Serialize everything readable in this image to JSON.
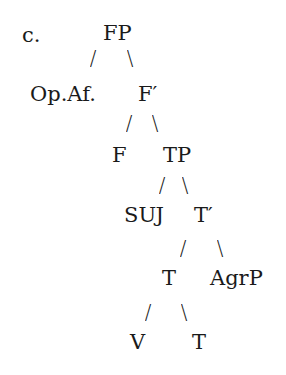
{
  "example_label": "c.",
  "tree": {
    "nodes": {
      "FP": "FP",
      "OpAf": "Op.Af.",
      "Fbar": "F′",
      "F": "F",
      "TP": "TP",
      "SUJ": "SUJ",
      "Tbar": "T′",
      "T_head": "T",
      "AgrP": "AgrP",
      "V": "V",
      "T_leaf": "T"
    },
    "branches": {
      "left": "/",
      "right": "\\"
    },
    "structure": [
      {
        "parent": "FP",
        "children": [
          "Op.Af.",
          "F′"
        ]
      },
      {
        "parent": "F′",
        "children": [
          "F",
          "TP"
        ]
      },
      {
        "parent": "TP",
        "children": [
          "SUJ",
          "T′"
        ]
      },
      {
        "parent": "T′",
        "children": [
          "T",
          "AgrP"
        ]
      },
      {
        "parent": "T",
        "children": [
          "V",
          "T"
        ]
      }
    ]
  },
  "colors": {
    "text": "#1a1a1a",
    "background": "#ffffff"
  }
}
